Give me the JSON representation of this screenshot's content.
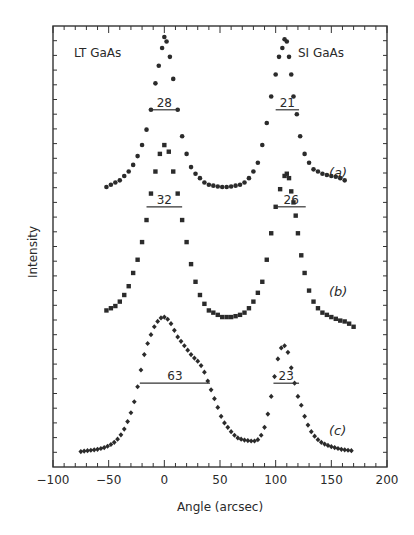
{
  "chart_data": {
    "type": "scatter",
    "title": "",
    "xlabel": "Angle (arcsec)",
    "ylabel": "Intensity",
    "xlim": [
      -100,
      200
    ],
    "ylim": [
      0,
      100
    ],
    "x_ticks": [
      -100,
      -50,
      0,
      50,
      100,
      150,
      200
    ],
    "x_tick_labels": [
      "-100",
      "-50",
      "0",
      "50",
      "100",
      "150",
      "200"
    ],
    "grid": false,
    "legend": null,
    "annotations": [
      {
        "text": "LT GaAs",
        "x": -75,
        "y": 94
      },
      {
        "text": "SI GaAs",
        "x": 130,
        "y": 94
      },
      {
        "text": "28",
        "type": "fwhm",
        "curve": "a",
        "peak": "LT",
        "x_from": -14,
        "x_to": 14,
        "y": 81
      },
      {
        "text": "21",
        "type": "fwhm",
        "curve": "a",
        "peak": "SI",
        "x_from": 100,
        "x_to": 121,
        "y": 81
      },
      {
        "text": "32",
        "type": "fwhm",
        "curve": "b",
        "peak": "LT",
        "x_from": -16,
        "x_to": 16,
        "y": 59
      },
      {
        "text": "26",
        "type": "fwhm",
        "curve": "b",
        "peak": "SI",
        "x_from": 101,
        "x_to": 127,
        "y": 59
      },
      {
        "text": "63",
        "type": "fwhm",
        "curve": "c",
        "peak": "LT",
        "x_from": -22,
        "x_to": 41,
        "y": 19
      },
      {
        "text": "23",
        "type": "fwhm",
        "curve": "c",
        "peak": "SI",
        "x_from": 98,
        "x_to": 121,
        "y": 19
      },
      {
        "text": "(a)",
        "x": 160,
        "y": 71
      },
      {
        "text": "(b)",
        "x": 160,
        "y": 37
      },
      {
        "text": "(c)",
        "x": 160,
        "y": 7
      }
    ],
    "series": [
      {
        "name": "(a)",
        "marker": "circle",
        "x": [
          -52,
          -48,
          -44,
          -40,
          -36,
          -32,
          -28,
          -24,
          -20,
          -16,
          -12,
          -8,
          -5,
          -2,
          0,
          2,
          5,
          8,
          12,
          16,
          20,
          24,
          28,
          32,
          36,
          40,
          44,
          48,
          52,
          56,
          60,
          64,
          68,
          72,
          76,
          80,
          84,
          88,
          92,
          96,
          100,
          103,
          106,
          108,
          110,
          112,
          114,
          116,
          119,
          122,
          126,
          130,
          134,
          138,
          142,
          146,
          150,
          154,
          158,
          162
        ],
        "y": [
          63.5,
          64,
          64.5,
          65,
          66,
          67,
          68.5,
          70.5,
          73,
          76.5,
          81,
          87,
          91,
          95,
          97.5,
          96.5,
          93,
          88,
          81,
          75,
          71,
          68,
          66.5,
          65.5,
          64.5,
          64,
          63.8,
          63.6,
          63.5,
          63.5,
          63.6,
          63.8,
          64,
          64.5,
          65.5,
          67,
          69,
          73,
          78,
          84,
          89,
          93,
          95,
          97,
          96.5,
          93,
          89,
          84,
          80,
          75,
          71,
          69,
          67.5,
          67,
          66.5,
          66.2,
          66,
          65.8,
          65.5,
          65
        ]
      },
      {
        "name": "(b)",
        "marker": "square",
        "x": [
          -52,
          -48,
          -44,
          -40,
          -36,
          -32,
          -28,
          -24,
          -20,
          -16,
          -12,
          -8,
          -4,
          0,
          4,
          8,
          12,
          16,
          20,
          24,
          28,
          32,
          36,
          40,
          44,
          48,
          52,
          56,
          60,
          64,
          68,
          72,
          76,
          80,
          84,
          88,
          92,
          96,
          100,
          104,
          108,
          110,
          112,
          114,
          116,
          118,
          120,
          123,
          126,
          130,
          134,
          138,
          142,
          146,
          150,
          154,
          158,
          162,
          166,
          170
        ],
        "y": [
          35.5,
          36,
          36.5,
          37.5,
          39,
          41,
          44,
          47,
          51,
          56,
          62,
          67,
          71,
          73,
          71.5,
          67,
          62,
          56,
          51,
          46,
          42,
          39,
          37,
          35.5,
          35,
          34.5,
          34,
          34,
          34,
          34.2,
          34.5,
          35,
          36,
          37.5,
          39.5,
          42,
          47,
          53,
          59,
          63,
          66,
          66.5,
          65.5,
          62.5,
          60,
          57,
          53,
          48,
          44,
          40,
          37.5,
          36,
          35,
          34.5,
          34,
          33.6,
          33.2,
          33,
          32.5,
          31.8
        ]
      },
      {
        "name": "(c)",
        "marker": "diamond",
        "x": [
          -75,
          -72,
          -69,
          -66,
          -63,
          -60,
          -57,
          -54,
          -51,
          -48,
          -45,
          -42,
          -39,
          -36,
          -33,
          -30,
          -27,
          -24,
          -21,
          -18,
          -15,
          -12,
          -9,
          -6,
          -3,
          0,
          3,
          6,
          9,
          12,
          15,
          18,
          21,
          24,
          27,
          30,
          33,
          36,
          39,
          42,
          45,
          48,
          51,
          54,
          57,
          60,
          63,
          66,
          69,
          72,
          75,
          78,
          81,
          84,
          87,
          90,
          93,
          96,
          99,
          102,
          105,
          108,
          111,
          114,
          117,
          120,
          123,
          126,
          129,
          132,
          135,
          138,
          141,
          144,
          147,
          150,
          153,
          156,
          159,
          162,
          165,
          168
        ],
        "y": [
          3.5,
          3.6,
          3.7,
          3.8,
          3.9,
          4,
          4.2,
          4.4,
          4.7,
          5.1,
          5.6,
          6.3,
          7.3,
          8.6,
          10.3,
          12.3,
          14.8,
          18.2,
          22,
          25.5,
          28,
          30,
          31.8,
          33,
          33.8,
          34,
          33.5,
          32.5,
          31,
          29.5,
          28.5,
          27.5,
          26.5,
          25.5,
          24.7,
          24,
          23,
          21.5,
          19.5,
          17.5,
          15.5,
          13.5,
          11.5,
          10,
          9,
          8,
          7.2,
          6.6,
          6.3,
          6.1,
          6,
          5.9,
          5.9,
          6.2,
          7.2,
          9,
          12,
          16,
          20.5,
          24.5,
          27,
          27.5,
          26,
          22.5,
          19,
          16,
          14,
          11.5,
          9.5,
          8,
          7,
          6.2,
          5.6,
          5.2,
          4.9,
          4.6,
          4.4,
          4.2,
          4,
          3.9,
          3.8,
          3.7
        ]
      }
    ]
  },
  "axes": {
    "xlabel": "Angle (arcsec)",
    "ylabel": "Intensity",
    "x_tick_labels": [
      "-100",
      "-50",
      "0",
      "50",
      "100",
      "150",
      "200"
    ]
  },
  "labels": {
    "lt": "LT GaAs",
    "si": "SI GaAs",
    "a": "(a)",
    "b": "(b)",
    "c": "(c)",
    "fwhm_a_lt": "28",
    "fwhm_a_si": "21",
    "fwhm_b_lt": "32",
    "fwhm_b_si": "26",
    "fwhm_c_lt": "63",
    "fwhm_c_si": "23"
  }
}
